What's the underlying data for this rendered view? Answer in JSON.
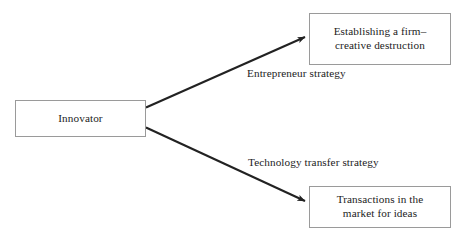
{
  "diagram": {
    "background_color": "#ffffff",
    "line_color": "#222222",
    "box_border_color": "#9a9a9a",
    "text_color": "#1c1c1c",
    "nodes": [
      {
        "id": "innovator",
        "label": "Innovator",
        "role": "source"
      },
      {
        "id": "establishing",
        "label": "Establishing a firm–\ncreative destruction",
        "role": "outcome-top"
      },
      {
        "id": "transactions",
        "label": "Transactions in the\nmarket for ideas",
        "role": "outcome-bottom"
      }
    ],
    "edges": [
      {
        "id": "edge-entrepreneur",
        "from": "innovator",
        "to": "establishing",
        "label": "Entrepreneur strategy",
        "arrowhead": true
      },
      {
        "id": "edge-technology",
        "from": "innovator",
        "to": "transactions",
        "label": "Technology transfer strategy",
        "arrowhead": true
      }
    ]
  }
}
